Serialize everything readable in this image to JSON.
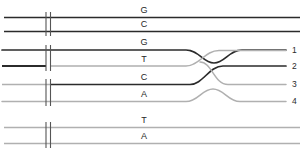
{
  "figure": {
    "type": "nucleotide-trace-diagram",
    "width": 304,
    "height": 149,
    "background": "#ffffff"
  },
  "colors": {
    "dark_line": "#2b2b2b",
    "light_line": "#b0b0b0",
    "tick": "#555555",
    "text": "#262626"
  },
  "tick_marks": {
    "label": "double-tick-break",
    "x1": 46,
    "x2": 50.5,
    "count": 2
  },
  "rows": [
    {
      "id": "row-1",
      "letter": "G",
      "y": 17.5,
      "shade": "dark",
      "shape": "straight",
      "label_x": 144,
      "label_y": 6,
      "end_number": null
    },
    {
      "id": "row-2",
      "letter": "C",
      "y": 31.5,
      "shade": "dark",
      "shape": "straight",
      "label_x": 144,
      "label_y": 20,
      "end_number": null
    },
    {
      "id": "row-3",
      "letter": "G",
      "y": 50.0,
      "shade": "dark",
      "shape": "dip",
      "label_x": 144,
      "label_y": 38,
      "end_number": "1",
      "number_x": 293,
      "number_y": 45
    },
    {
      "id": "row-4",
      "letter": "T",
      "y": 66.0,
      "shade": "split-dark-then-light",
      "shape": "rise-cross",
      "label_x": 144,
      "label_y": 55,
      "end_number": "2",
      "number_x": 293,
      "number_y": 62
    },
    {
      "id": "row-5",
      "letter": "C",
      "y": 84.5,
      "shade": "split-light-then-dark",
      "shape": "fall-cross",
      "label_x": 144,
      "label_y": 73,
      "end_number": "3",
      "number_x": 293,
      "number_y": 80
    },
    {
      "id": "row-6",
      "letter": "A",
      "y": 101.5,
      "shade": "light",
      "shape": "bump",
      "label_x": 144,
      "label_y": 90,
      "end_number": "4",
      "number_x": 293,
      "number_y": 97
    },
    {
      "id": "row-7",
      "letter": "T",
      "y": 127.5,
      "shade": "light",
      "shape": "straight",
      "label_x": 144,
      "label_y": 116,
      "end_number": null
    },
    {
      "id": "row-8",
      "letter": "A",
      "y": 143.5,
      "shade": "light",
      "shape": "straight",
      "label_x": 144,
      "label_y": 132,
      "end_number": null
    }
  ],
  "end_numbers": [
    {
      "value": "1",
      "row": "row-3"
    },
    {
      "value": "2",
      "row": "row-4"
    },
    {
      "value": "3",
      "row": "row-5"
    },
    {
      "value": "4",
      "row": "row-6"
    }
  ]
}
